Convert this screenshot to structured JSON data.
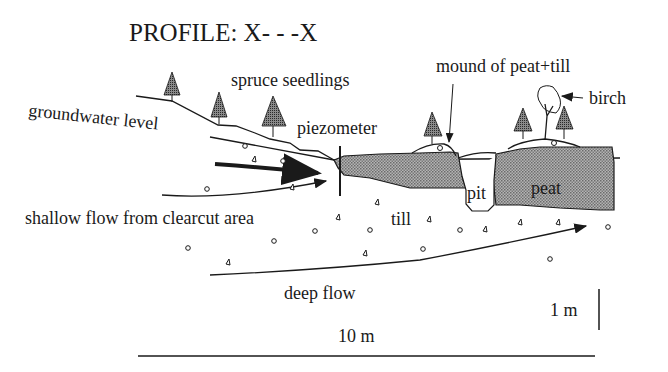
{
  "title": "PROFILE: X- - -X",
  "labels": {
    "spruce": "spruce seedlings",
    "mound": "mound of peat+till",
    "birch": "birch",
    "groundwater": "groundwater level",
    "piezometer": "piezometer",
    "shallow_flow": "shallow flow from clearcut area",
    "till": "till",
    "pit": "pit",
    "peat": "peat",
    "deep_flow": "deep flow"
  },
  "scale": {
    "vertical": "1 m",
    "horizontal": "10 m"
  },
  "colors": {
    "ink": "#1a1a1a",
    "peat_fill": "#9a9a9a",
    "tree_fill": "#6e6e6e"
  }
}
